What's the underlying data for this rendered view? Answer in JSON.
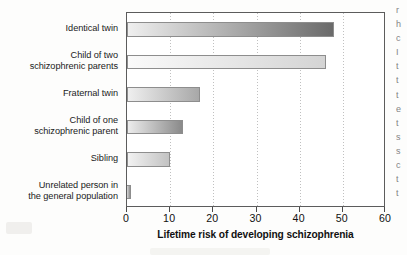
{
  "chart_data": {
    "type": "bar",
    "orientation": "horizontal",
    "title": "",
    "xlabel": "Lifetime risk of developing schizophrenia",
    "ylabel": "",
    "xlim": [
      0,
      60
    ],
    "ylim": null,
    "xticks": [
      0,
      10,
      20,
      30,
      40,
      50,
      60
    ],
    "xtick_labels": [
      "0",
      "10",
      "20",
      "30",
      "40",
      "50",
      "60"
    ],
    "grid": "vertical dotted gridlines at each x tick",
    "legend": null,
    "categories": [
      "Identical twin",
      "Child of two schizophrenic parents",
      "Fraternal twin",
      "Child of one schizophrenic parent",
      "Sibling",
      "Unrelated person in the general population"
    ],
    "category_label_lines": [
      [
        "Identical twin"
      ],
      [
        "Child of two",
        "schizophrenic parents"
      ],
      [
        "Fraternal twin"
      ],
      [
        "Child of one",
        "schizophrenic parent"
      ],
      [
        "Sibling"
      ],
      [
        "Unrelated person in",
        "the general population"
      ]
    ],
    "values": [
      48,
      46,
      17,
      13,
      10,
      1
    ],
    "bar_fill_style": "horizontal gradient, light gray at left to darker gray at right",
    "bar_gradients": [
      {
        "from": "#efefef",
        "to": "#6a6a6a"
      },
      {
        "from": "#fafafa",
        "to": "#d4d4d4"
      },
      {
        "from": "#efefef",
        "to": "#a8a8a8"
      },
      {
        "from": "#ececec",
        "to": "#8a8a8a"
      },
      {
        "from": "#f2f2f2",
        "to": "#c2c2c2"
      },
      {
        "from": "#d8d8d8",
        "to": "#8f8f8f"
      }
    ],
    "bar_border_color": "#8d8d8d",
    "axis_color": "#5c5c5c",
    "text_color": "#111111",
    "background_color": "#ffffff"
  },
  "page_bleed": {
    "lines": [
      "r",
      "h",
      "c",
      "I",
      "t",
      "t",
      "t",
      "e",
      "t",
      "s",
      "s",
      "c",
      "t",
      "t"
    ]
  }
}
